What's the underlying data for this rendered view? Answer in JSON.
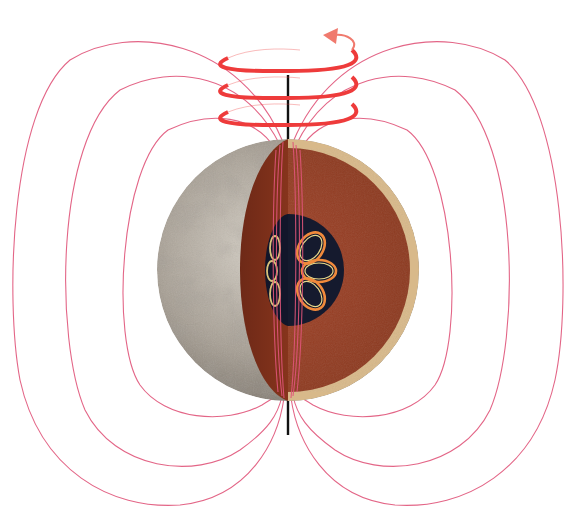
{
  "diagram": {
    "subject": "Planetary dynamo: magnetic field generated by convection in a rotating metallic core",
    "labels": [],
    "colors": {
      "background": "#ffffff",
      "field_lines": "#e0557a",
      "rotation_rings": "#ee3b3b",
      "rotation_arrow": "#f07a6e",
      "axis": "#111111",
      "surface": "#9c958b",
      "surface_light": "#cfc9bf",
      "mantle": "#9a3f22",
      "mantle_dark": "#7e2f19",
      "crust": "#d8b98a",
      "core": "#151a2e",
      "convection_cells_outer": "#f08a3c",
      "convection_cells_inner": "#e7d88a"
    },
    "components": [
      {
        "name": "rotation-axis",
        "description": "Vertical black line through the body"
      },
      {
        "name": "rotation-indicator",
        "description": "Three red spiral rings with arrowhead showing spin direction"
      },
      {
        "name": "planet-surface",
        "description": "Gray cratered surface on left hemisphere"
      },
      {
        "name": "mantle-cutaway",
        "description": "Brown mantle exposed by cutaway with tan crust rim"
      },
      {
        "name": "core",
        "description": "Dark navy metallic core"
      },
      {
        "name": "convection-cells",
        "description": "Six looping orange/yellow convection cells in the core"
      },
      {
        "name": "magnetic-field-lines",
        "description": "Three dipole field-line loops on each side"
      }
    ],
    "field_loops_per_side": 3,
    "convection_cells_count": 6,
    "rotation_rings_count": 3
  }
}
